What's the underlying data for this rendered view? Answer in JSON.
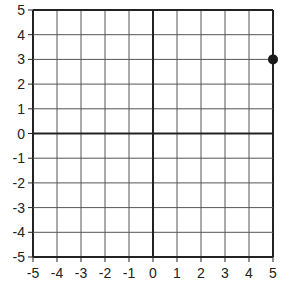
{
  "chart_data": {
    "type": "scatter",
    "title": "",
    "xlabel": "",
    "ylabel": "",
    "xlim": [
      -5,
      5
    ],
    "ylim": [
      -5,
      5
    ],
    "grid": true,
    "x_ticks": [
      -5,
      -4,
      -3,
      -2,
      -1,
      0,
      1,
      2,
      3,
      4,
      5
    ],
    "y_ticks": [
      5,
      4,
      3,
      2,
      1,
      0,
      -1,
      -2,
      -3,
      -4,
      -5
    ],
    "x_tick_labels": [
      "-5",
      "-4",
      "-3",
      "-2",
      "-1",
      "0",
      "1",
      "2",
      "3",
      "4",
      "5"
    ],
    "y_tick_labels": [
      "5",
      "4",
      "3",
      "2",
      "1",
      "0",
      "-1",
      "-2",
      "-3",
      "-4",
      "-5"
    ],
    "series": [
      {
        "name": "point",
        "points": [
          {
            "x": 5,
            "y": 3
          }
        ]
      }
    ],
    "legend": null
  },
  "colors": {
    "grid": "#555555",
    "axis": "#222222",
    "point": "#1a1a1a",
    "text": "#222222"
  }
}
